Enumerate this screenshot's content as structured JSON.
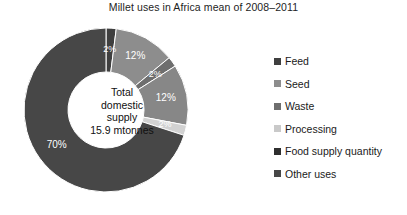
{
  "chart_data": {
    "type": "pie",
    "title": "Millet uses in Africa mean of 2008–2011",
    "subtitle": "",
    "xlabel": "",
    "ylabel": "",
    "donut": true,
    "legend_position": "right",
    "grid": false,
    "center_label": {
      "line1": "Total",
      "line2": "domestic",
      "line3": "supply",
      "line4": "15.9 mtonnes"
    },
    "categories": [
      "Feed",
      "Seed",
      "Waste",
      "Processing",
      "Food supply quantity",
      "Other uses"
    ],
    "values": [
      2,
      12,
      2,
      12,
      2,
      70
    ],
    "value_labels": [
      "2%",
      "12%",
      "2%",
      "12%",
      "2%",
      "70%"
    ],
    "colors": [
      "#3f3f3f",
      "#8d8d8d",
      "#6e6e6e",
      "#878787",
      "#d2d2d2",
      "#474747"
    ],
    "slices": [
      {
        "name": "Feed",
        "value": 2,
        "label": "2%",
        "color": "#3f3f3f"
      },
      {
        "name": "Seed",
        "value": 12,
        "label": "12%",
        "color": "#8d8d8d"
      },
      {
        "name": "Waste",
        "value": 2,
        "label": "2%",
        "color": "#6e6e6e"
      },
      {
        "name": "Processing",
        "value": 12,
        "label": "12%",
        "color": "#878787"
      },
      {
        "name": "Food supply quantity",
        "value": 2,
        "label": "2%",
        "color": "#d2d2d2"
      },
      {
        "name": "Other uses",
        "value": 70,
        "label": "70%",
        "color": "#474747"
      }
    ]
  },
  "legend": {
    "items": [
      {
        "label": "Feed",
        "color": "#3f3f3f"
      },
      {
        "label": "Seed",
        "color": "#8d8d8d"
      },
      {
        "label": "Waste",
        "color": "#6e6e6e"
      },
      {
        "label": "Processing",
        "color": "#c9c9c9"
      },
      {
        "label": "Food supply quantity",
        "color": "#2f2f2f"
      },
      {
        "label": "Other uses",
        "color": "#474747"
      }
    ]
  }
}
